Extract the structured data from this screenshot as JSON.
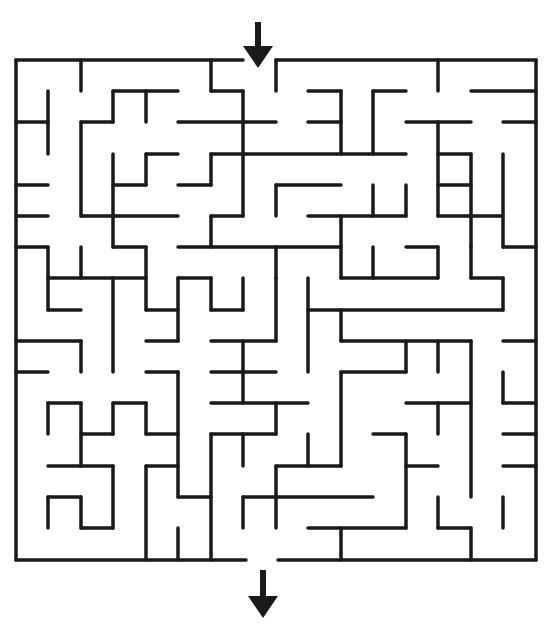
{
  "puzzle": {
    "type": "maze",
    "title": "Maze",
    "grid": {
      "cols": 16,
      "rows": 16
    },
    "colors": {
      "wall": "#1a1a1a",
      "background": "#ffffff",
      "arrow": "#1a1a1a"
    },
    "entrance": {
      "label": "entrance-arrow",
      "icon": "arrow-down-icon",
      "x": 258,
      "shaft": [
        22,
        46
      ],
      "head": [
        46,
        68
      ],
      "half_width": 15
    },
    "exit": {
      "label": "exit-arrow",
      "icon": "arrow-down-icon",
      "x": 263,
      "shaft": [
        570,
        596
      ],
      "head": [
        596,
        618
      ],
      "half_width": 15
    },
    "walls": [
      [
        16,
        60,
        243,
        60
      ],
      [
        276,
        60,
        536,
        60
      ],
      [
        536,
        60,
        536,
        560
      ],
      [
        16,
        60,
        16,
        560
      ],
      [
        16,
        560,
        246,
        560
      ],
      [
        278,
        560,
        536,
        560
      ],
      [
        81,
        60,
        81,
        91
      ],
      [
        211,
        60,
        211,
        91
      ],
      [
        211,
        91,
        243,
        91
      ],
      [
        243,
        91,
        243,
        216
      ],
      [
        276,
        60,
        276,
        91
      ],
      [
        438,
        60,
        438,
        91
      ],
      [
        48,
        91,
        48,
        154
      ],
      [
        16,
        122,
        48,
        122
      ],
      [
        113,
        91,
        178,
        91
      ],
      [
        113,
        91,
        113,
        122
      ],
      [
        81,
        122,
        113,
        122
      ],
      [
        81,
        122,
        81,
        216
      ],
      [
        146,
        91,
        146,
        122
      ],
      [
        178,
        122,
        276,
        122
      ],
      [
        308,
        91,
        341,
        91
      ],
      [
        341,
        91,
        341,
        154
      ],
      [
        373,
        91,
        406,
        91
      ],
      [
        373,
        91,
        373,
        154
      ],
      [
        471,
        91,
        536,
        91
      ],
      [
        308,
        122,
        341,
        122
      ],
      [
        406,
        122,
        471,
        122
      ],
      [
        438,
        122,
        438,
        216
      ],
      [
        503,
        122,
        536,
        122
      ],
      [
        146,
        154,
        178,
        154
      ],
      [
        146,
        154,
        146,
        185
      ],
      [
        113,
        185,
        146,
        185
      ],
      [
        113,
        154,
        113,
        247
      ],
      [
        211,
        154,
        406,
        154
      ],
      [
        211,
        154,
        211,
        185
      ],
      [
        178,
        185,
        211,
        185
      ],
      [
        16,
        185,
        48,
        185
      ],
      [
        438,
        154,
        471,
        154
      ],
      [
        471,
        154,
        471,
        247
      ],
      [
        276,
        185,
        341,
        185
      ],
      [
        276,
        185,
        276,
        216
      ],
      [
        373,
        185,
        373,
        216
      ],
      [
        406,
        185,
        406,
        216
      ],
      [
        438,
        185,
        471,
        185
      ],
      [
        16,
        216,
        48,
        216
      ],
      [
        81,
        216,
        178,
        216
      ],
      [
        211,
        216,
        243,
        216
      ],
      [
        211,
        216,
        211,
        247
      ],
      [
        308,
        216,
        406,
        216
      ],
      [
        341,
        216,
        341,
        278
      ],
      [
        438,
        216,
        503,
        216
      ],
      [
        503,
        154,
        503,
        247
      ],
      [
        503,
        247,
        536,
        247
      ],
      [
        16,
        247,
        48,
        247
      ],
      [
        48,
        247,
        48,
        310
      ],
      [
        113,
        247,
        146,
        247
      ],
      [
        146,
        247,
        146,
        310
      ],
      [
        178,
        247,
        341,
        247
      ],
      [
        276,
        247,
        276,
        278
      ],
      [
        81,
        247,
        81,
        278
      ],
      [
        48,
        278,
        146,
        278
      ],
      [
        178,
        278,
        211,
        278
      ],
      [
        211,
        278,
        211,
        310
      ],
      [
        211,
        310,
        243,
        310
      ],
      [
        243,
        278,
        243,
        310
      ],
      [
        341,
        278,
        438,
        278
      ],
      [
        406,
        247,
        438,
        247
      ],
      [
        438,
        247,
        438,
        278
      ],
      [
        373,
        247,
        373,
        278
      ],
      [
        471,
        247,
        471,
        278
      ],
      [
        471,
        278,
        503,
        278
      ],
      [
        503,
        278,
        503,
        310
      ],
      [
        308,
        310,
        503,
        310
      ],
      [
        48,
        310,
        81,
        310
      ],
      [
        146,
        310,
        178,
        310
      ],
      [
        178,
        278,
        178,
        341
      ],
      [
        113,
        278,
        113,
        372
      ],
      [
        308,
        278,
        308,
        372
      ],
      [
        276,
        278,
        276,
        341
      ],
      [
        341,
        310,
        341,
        341
      ],
      [
        341,
        341,
        471,
        341
      ],
      [
        503,
        341,
        536,
        341
      ],
      [
        16,
        341,
        81,
        341
      ],
      [
        81,
        341,
        81,
        372
      ],
      [
        146,
        341,
        178,
        341
      ],
      [
        211,
        341,
        276,
        341
      ],
      [
        243,
        341,
        243,
        403
      ],
      [
        406,
        341,
        406,
        372
      ],
      [
        438,
        341,
        438,
        372
      ],
      [
        16,
        372,
        48,
        372
      ],
      [
        146,
        372,
        178,
        372
      ],
      [
        178,
        372,
        178,
        497
      ],
      [
        211,
        372,
        276,
        372
      ],
      [
        341,
        372,
        406,
        372
      ],
      [
        341,
        372,
        341,
        466
      ],
      [
        471,
        341,
        471,
        497
      ],
      [
        503,
        372,
        503,
        403
      ],
      [
        503,
        403,
        536,
        403
      ],
      [
        211,
        403,
        308,
        403
      ],
      [
        276,
        403,
        276,
        434
      ],
      [
        406,
        403,
        471,
        403
      ],
      [
        438,
        403,
        438,
        434
      ],
      [
        48,
        403,
        81,
        403
      ],
      [
        48,
        403,
        48,
        434
      ],
      [
        81,
        403,
        81,
        466
      ],
      [
        113,
        403,
        146,
        403
      ],
      [
        113,
        403,
        113,
        434
      ],
      [
        146,
        403,
        146,
        434
      ],
      [
        146,
        434,
        178,
        434
      ],
      [
        81,
        434,
        113,
        434
      ],
      [
        211,
        434,
        276,
        434
      ],
      [
        211,
        434,
        211,
        560
      ],
      [
        243,
        434,
        243,
        466
      ],
      [
        308,
        434,
        308,
        466
      ],
      [
        276,
        466,
        341,
        466
      ],
      [
        276,
        466,
        276,
        528
      ],
      [
        373,
        434,
        406,
        434
      ],
      [
        406,
        434,
        406,
        528
      ],
      [
        406,
        466,
        438,
        466
      ],
      [
        503,
        434,
        536,
        434
      ],
      [
        48,
        466,
        113,
        466
      ],
      [
        146,
        466,
        178,
        466
      ],
      [
        146,
        466,
        146,
        560
      ],
      [
        503,
        466,
        536,
        466
      ],
      [
        48,
        497,
        81,
        497
      ],
      [
        48,
        497,
        48,
        528
      ],
      [
        81,
        497,
        81,
        528
      ],
      [
        81,
        528,
        113,
        528
      ],
      [
        113,
        466,
        113,
        528
      ],
      [
        178,
        497,
        211,
        497
      ],
      [
        243,
        497,
        276,
        497
      ],
      [
        243,
        497,
        243,
        528
      ],
      [
        276,
        497,
        373,
        497
      ],
      [
        438,
        497,
        438,
        528
      ],
      [
        438,
        528,
        471,
        528
      ],
      [
        471,
        528,
        471,
        560
      ],
      [
        503,
        497,
        503,
        528
      ],
      [
        308,
        528,
        406,
        528
      ],
      [
        341,
        528,
        341,
        560
      ],
      [
        178,
        528,
        178,
        560
      ]
    ]
  }
}
